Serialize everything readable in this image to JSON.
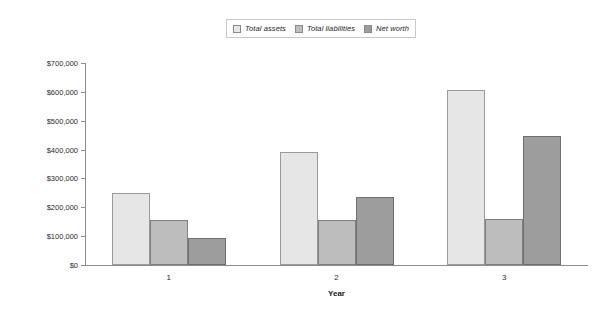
{
  "chart_data": {
    "type": "bar",
    "title": "",
    "xlabel": "Year",
    "ylabel": "",
    "categories": [
      "1",
      "2",
      "3"
    ],
    "series": [
      {
        "name": "Total assets",
        "color": "#e6e6e6",
        "values": [
          250000,
          390000,
          605000
        ]
      },
      {
        "name": "Total liabilities",
        "color": "#bdbdbd",
        "values": [
          155000,
          155000,
          158000
        ]
      },
      {
        "name": "Net worth",
        "color": "#9d9d9d",
        "values": [
          95000,
          235000,
          447000
        ]
      }
    ],
    "ylim": [
      0,
      700000
    ],
    "ytick_values": [
      0,
      100000,
      200000,
      300000,
      400000,
      500000,
      600000,
      700000
    ],
    "ytick_labels": [
      "$0",
      "$100,000",
      "$200,000",
      "$300,000",
      "$400,000",
      "$500,000",
      "$600,000",
      "$700,000"
    ],
    "grid": false,
    "legend_position": "top-center"
  },
  "legend": {
    "items": [
      {
        "label": "Total assets",
        "swatch": "#e6e6e6"
      },
      {
        "label": "Total liabilities",
        "swatch": "#bdbdbd"
      },
      {
        "label": "Net worth",
        "swatch": "#9d9d9d"
      }
    ]
  },
  "axes": {
    "x_title": "Year"
  }
}
